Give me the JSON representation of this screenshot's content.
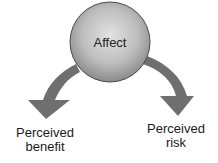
{
  "diagram": {
    "nodes": [
      {
        "id": "affect",
        "label": "Affect",
        "shape": "circle"
      },
      {
        "id": "benefit",
        "label_line1": "Perceived",
        "label_line2": "benefit"
      },
      {
        "id": "risk",
        "label_line1": "Perceived",
        "label_line2": "risk"
      }
    ],
    "edges": [
      {
        "from": "affect",
        "to": "benefit",
        "style": "curved-block-arrow"
      },
      {
        "from": "affect",
        "to": "risk",
        "style": "curved-block-arrow"
      }
    ],
    "colors": {
      "circle_center": "#dedede",
      "circle_edge": "#8c8c8c",
      "circle_outline": "#4a4a4a",
      "arrow_fill": "#6f6f6f",
      "text": "#1a1a1a"
    }
  }
}
